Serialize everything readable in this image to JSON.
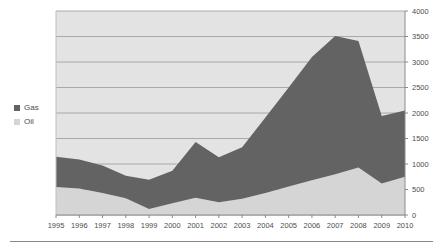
{
  "legend": {
    "position": "left-middle",
    "items": [
      {
        "label": "Gas",
        "color": "#636363"
      },
      {
        "label": "Oil",
        "color": "#d5d5d5"
      }
    ]
  },
  "axes": {
    "y_ticks": [
      "0",
      "500",
      "1000",
      "1500",
      "2000",
      "2500",
      "3000",
      "3500",
      "4000"
    ],
    "x_ticks": [
      "1995",
      "1996",
      "1997",
      "1998",
      "1999",
      "2000",
      "2001",
      "2002",
      "2003",
      "2004",
      "2005",
      "2006",
      "2007",
      "2008",
      "2009",
      "2010"
    ]
  },
  "style": {
    "plot_background": "#e3e3e3",
    "gridline_color": "#9a9a9a",
    "axis_color": "#8a8a8a",
    "text_color": "#4d4d4d"
  },
  "chart_data": {
    "type": "area",
    "stacked": true,
    "title": "",
    "xlabel": "",
    "ylabel": "",
    "ylim": [
      0,
      4000
    ],
    "grid": true,
    "legend_position": "left",
    "categories": [
      "1995",
      "1996",
      "1997",
      "1998",
      "1999",
      "2000",
      "2001",
      "2002",
      "2003",
      "2004",
      "2005",
      "2006",
      "2007",
      "2008",
      "2009",
      "2010"
    ],
    "series": [
      {
        "name": "Oil",
        "color": "#d5d5d5",
        "values": [
          550,
          520,
          430,
          330,
          120,
          230,
          340,
          250,
          320,
          430,
          560,
          680,
          800,
          930,
          620,
          750
        ]
      },
      {
        "name": "Gas",
        "color": "#636363",
        "values": [
          590,
          570,
          540,
          440,
          570,
          640,
          1090,
          880,
          1010,
          1480,
          1940,
          2420,
          2710,
          2480,
          1320,
          1300
        ]
      }
    ],
    "totals": [
      1140,
      1090,
      970,
      770,
      690,
      870,
      1430,
      1130,
      1330,
      1910,
      2500,
      3100,
      3510,
      3410,
      1940,
      2050
    ]
  }
}
